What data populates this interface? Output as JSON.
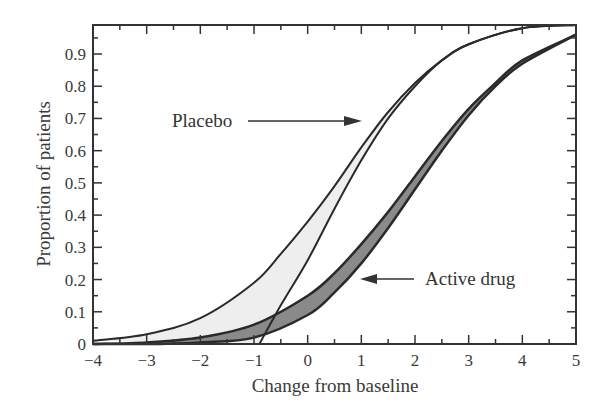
{
  "chart_data": {
    "type": "line",
    "title": "",
    "xlabel": "Change from baseline",
    "ylabel": "Proportion of patients",
    "xlim": [
      -4,
      5
    ],
    "ylim": [
      0,
      0.99
    ],
    "x_ticks": [
      -4,
      -3,
      -2,
      -1,
      0,
      1,
      2,
      3,
      4,
      5
    ],
    "y_ticks": [
      0,
      0.1,
      0.2,
      0.3,
      0.4,
      0.5,
      0.6,
      0.7,
      0.8,
      0.9
    ],
    "x_tick_labels": [
      "−4",
      "−3",
      "−2",
      "−1",
      "0",
      "1",
      "2",
      "3",
      "4",
      "5"
    ],
    "y_tick_labels": [
      "0",
      "0.1",
      "0.2",
      "0.3",
      "0.4",
      "0.5",
      "0.6",
      "0.7",
      "0.8",
      "0.9"
    ],
    "grid": false,
    "legend": null,
    "series": [
      {
        "name": "Placebo (upper bound)",
        "band": "Placebo",
        "x": [
          -4,
          -3,
          -2,
          -1,
          -0.5,
          0,
          0.5,
          1,
          1.5,
          2,
          2.5,
          3,
          4,
          5
        ],
        "y": [
          0.01,
          0.03,
          0.08,
          0.19,
          0.28,
          0.38,
          0.49,
          0.61,
          0.72,
          0.81,
          0.88,
          0.93,
          0.98,
          0.99
        ]
      },
      {
        "name": "Placebo (lower bound)",
        "band": "Placebo",
        "x": [
          -0.9,
          -0.5,
          0,
          0.5,
          1,
          1.5,
          2,
          2.5,
          3,
          4,
          5
        ],
        "y": [
          0.0,
          0.12,
          0.26,
          0.42,
          0.57,
          0.7,
          0.8,
          0.88,
          0.93,
          0.98,
          0.99
        ]
      },
      {
        "name": "Active drug (upper bound)",
        "band": "Active drug",
        "x": [
          -4,
          -3,
          -2,
          -1,
          0,
          0.5,
          1,
          1.5,
          2,
          2.5,
          3,
          3.5,
          4,
          5
        ],
        "y": [
          0.0,
          0.005,
          0.02,
          0.06,
          0.15,
          0.22,
          0.31,
          0.41,
          0.52,
          0.63,
          0.73,
          0.81,
          0.88,
          0.96
        ]
      },
      {
        "name": "Active drug (lower bound)",
        "band": "Active drug",
        "x": [
          -4,
          -3,
          -2,
          -1,
          0,
          0.5,
          1,
          1.5,
          2,
          2.5,
          3,
          3.5,
          4,
          5
        ],
        "y": [
          0.0,
          0.0,
          0.005,
          0.02,
          0.09,
          0.16,
          0.25,
          0.36,
          0.48,
          0.6,
          0.71,
          0.8,
          0.87,
          0.96
        ]
      }
    ],
    "bands": [
      {
        "name": "Placebo",
        "fill": "#eeeeee"
      },
      {
        "name": "Active drug",
        "fill": "#8a8a8a"
      }
    ],
    "annotations": [
      {
        "text": "Placebo",
        "arrow_to": [
          1.25,
          0.7
        ],
        "text_pos": [
          -1.5,
          0.7
        ]
      },
      {
        "text": "Active drug",
        "arrow_to": [
          1.25,
          0.2
        ],
        "text_pos": [
          2.5,
          0.2
        ]
      }
    ]
  },
  "labels": {
    "xlabel": "Change from baseline",
    "ylabel": "Proportion of patients",
    "placebo": "Placebo",
    "active": "Active drug"
  }
}
